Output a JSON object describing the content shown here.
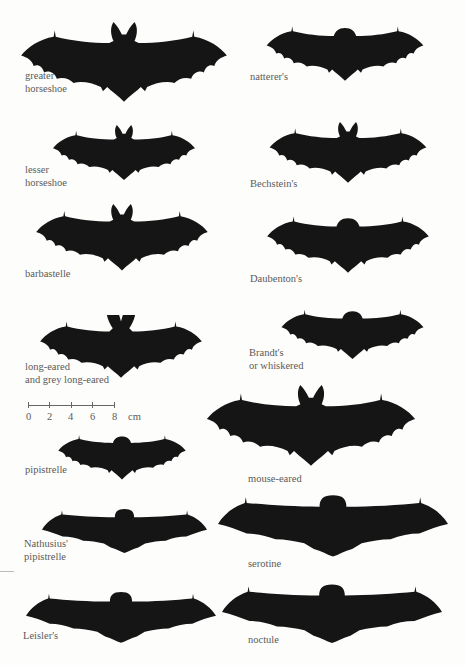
{
  "figure": {
    "silhouette_color": "#151515",
    "background_color": "#fdfdfb",
    "label_color": "#5a5a5a"
  },
  "scale_bar": {
    "ticks": [
      "0",
      "2",
      "4",
      "6",
      "8"
    ],
    "unit": "cm"
  },
  "bats": [
    {
      "name": "greater-horseshoe",
      "label_lines": [
        "greater",
        "horseshoe"
      ]
    },
    {
      "name": "natterers",
      "label_lines": [
        "natterer's"
      ]
    },
    {
      "name": "lesser-horseshoe",
      "label_lines": [
        "lesser",
        "horseshoe"
      ]
    },
    {
      "name": "bechsteins",
      "label_lines": [
        "Bechstein's"
      ]
    },
    {
      "name": "barbastelle",
      "label_lines": [
        "barbastelle"
      ]
    },
    {
      "name": "daubentons",
      "label_lines": [
        "Daubenton's"
      ]
    },
    {
      "name": "long-eared",
      "label_lines": [
        "long-eared",
        "and grey long-eared"
      ]
    },
    {
      "name": "brandts",
      "label_lines": [
        "Brandt's",
        "or whiskered"
      ]
    },
    {
      "name": "pipistrelle",
      "label_lines": [
        "pipistrelle"
      ]
    },
    {
      "name": "mouse-eared",
      "label_lines": [
        "mouse-eared"
      ]
    },
    {
      "name": "nathusius-pipistrelle",
      "label_lines": [
        "Nathusius'",
        "pipistrelle"
      ]
    },
    {
      "name": "serotine",
      "label_lines": [
        "serotine"
      ]
    },
    {
      "name": "leislers",
      "label_lines": [
        "Leisler's"
      ]
    },
    {
      "name": "noctule",
      "label_lines": [
        "noctule"
      ]
    }
  ]
}
